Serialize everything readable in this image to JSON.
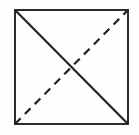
{
  "figure": {
    "type": "geometric-diagram",
    "background_color": "#fefefe",
    "canvas": {
      "width": 139,
      "height": 135
    },
    "square": {
      "name": "square-outline",
      "left": 14,
      "top": 9,
      "right": 129,
      "bottom": 125,
      "width": 115,
      "height": 116,
      "stroke_color": "#2b2b2b",
      "stroke_width": 2.4,
      "fill": "none"
    },
    "diagonals": [
      {
        "name": "solid-diagonal",
        "from": "top-left",
        "to": "bottom-right",
        "x1": 15,
        "y1": 10,
        "x2": 128,
        "y2": 124,
        "style": "solid",
        "stroke_color": "#232323",
        "stroke_width": 2.2,
        "dash_pattern": ""
      },
      {
        "name": "dashed-diagonal",
        "from": "bottom-left",
        "to": "top-right",
        "x1": 15,
        "y1": 124,
        "x2": 128,
        "y2": 10,
        "style": "dashed",
        "stroke_color": "#232323",
        "stroke_width": 2.2,
        "dash_pattern": "8 6"
      }
    ],
    "intersection": {
      "name": "diagonal-intersection",
      "x": 71,
      "y": 67
    },
    "corners": [
      {
        "name": "corner-top-left",
        "x": 15,
        "y": 10
      },
      {
        "name": "corner-top-right",
        "x": 128,
        "y": 10
      },
      {
        "name": "corner-bottom-right",
        "x": 128,
        "y": 124
      },
      {
        "name": "corner-bottom-left",
        "x": 15,
        "y": 124
      }
    ]
  }
}
